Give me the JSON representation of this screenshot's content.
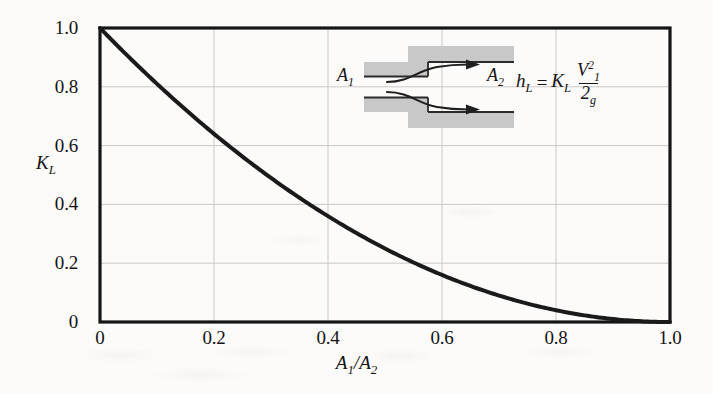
{
  "figure": {
    "kind": "loss-coefficient-chart",
    "background_color": "#fcfbf9",
    "ink_color": "#141414",
    "grid_color": "#c9c9c9",
    "curve_color": "#1a1a1a",
    "pipe_fill_color": "#c8c8c8"
  },
  "axes": {
    "y_label": "K",
    "y_label_sub": "L",
    "x_label_num": "A",
    "x_label_num_sub": "1",
    "x_label_den": "A",
    "x_label_den_sub": "2",
    "x_label_slash": "/"
  },
  "inset": {
    "inlet_label": "A",
    "inlet_label_sub": "1",
    "outlet_label": "A",
    "outlet_label_sub": "2",
    "formula": {
      "lhs": "h",
      "lhs_sub": "L",
      "equals": "=",
      "coeff": "K",
      "coeff_sub": "L",
      "num": "V",
      "num_sub": "1",
      "num_sup": "2",
      "den": "2",
      "den_sub": "g"
    }
  },
  "chart_data": {
    "type": "line",
    "title": "",
    "subtitle": "",
    "xlabel": "A1/A2",
    "ylabel": "KL",
    "xlim": [
      0,
      1.0
    ],
    "ylim": [
      0,
      1.0
    ],
    "grid": true,
    "legend": null,
    "xticks": [
      0,
      0.2,
      0.4,
      0.6,
      0.8,
      1.0
    ],
    "xticklabels": [
      "0",
      "0.2",
      "0.4",
      "0.6",
      "0.8",
      "1.0"
    ],
    "yticks": [
      0,
      0.2,
      0.4,
      0.6,
      0.8,
      1.0
    ],
    "yticklabels": [
      "0",
      "0.2",
      "0.4",
      "0.6",
      "0.8",
      "1.0"
    ],
    "relation": "K_L = (1 - A1/A2)^2",
    "series": [
      {
        "name": "K_L sudden expansion",
        "x": [
          0,
          0.05,
          0.1,
          0.15,
          0.2,
          0.25,
          0.3,
          0.35,
          0.4,
          0.45,
          0.5,
          0.55,
          0.6,
          0.65,
          0.7,
          0.75,
          0.8,
          0.85,
          0.9,
          0.95,
          1.0
        ],
        "values": [
          1.0,
          0.9025,
          0.81,
          0.7225,
          0.64,
          0.5625,
          0.49,
          0.4225,
          0.36,
          0.3025,
          0.25,
          0.2025,
          0.16,
          0.1225,
          0.09,
          0.0625,
          0.04,
          0.0225,
          0.01,
          0.0025,
          0.0
        ]
      }
    ]
  }
}
